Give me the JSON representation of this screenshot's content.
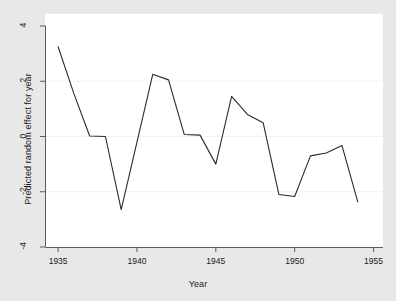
{
  "chart_data": {
    "type": "line",
    "title": "",
    "xlabel": "Year",
    "ylabel": "Predicted random effect for year",
    "xlim": [
      1934.2,
      1955.6
    ],
    "ylim": [
      -4,
      4
    ],
    "xticks": [
      1935,
      1940,
      1945,
      1950,
      1955
    ],
    "xtick_labels": [
      "1935",
      "1940",
      "1945",
      "1950",
      "1955"
    ],
    "yticks": [
      -4,
      -2,
      0,
      2,
      4
    ],
    "ytick_labels": [
      "-4",
      "-2",
      "0",
      "2",
      "4"
    ],
    "grid": "horizontal",
    "legend": "none",
    "series": [
      {
        "name": "Predicted random effect for year",
        "color": "#2b2b2b",
        "x": [
          1935,
          1936,
          1937,
          1938,
          1939,
          1940,
          1941,
          1942,
          1943,
          1944,
          1945,
          1946,
          1947,
          1948,
          1949,
          1950,
          1951,
          1952,
          1953,
          1954
        ],
        "values": [
          3.25,
          1.55,
          0.02,
          0.0,
          -2.65,
          -0.2,
          2.25,
          2.05,
          0.07,
          0.05,
          -1.0,
          1.45,
          0.8,
          0.5,
          -2.1,
          -2.17,
          -0.7,
          -0.6,
          -0.33,
          -2.37
        ]
      }
    ]
  },
  "figure": {
    "background_color": "#e8e8e8",
    "plot_background_color": "#ffffff",
    "axis_color": "#5a5a6e",
    "gridline_color": "#f2f2f2",
    "line_color": "#2b2b2b"
  }
}
